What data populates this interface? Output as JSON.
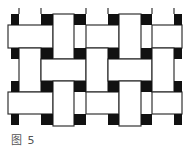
{
  "figure": {
    "caption": "图 5",
    "colors": {
      "background": "#ffffff",
      "ink": "#111111",
      "line": "#333333"
    }
  },
  "squares": [
    [
      11,
      14,
      8,
      11
    ],
    [
      41,
      14,
      12,
      11
    ],
    [
      74,
      14,
      12,
      11
    ],
    [
      108,
      14,
      11,
      11
    ],
    [
      141,
      14,
      11,
      11
    ],
    [
      174,
      14,
      8,
      11
    ],
    [
      11,
      48,
      8,
      11
    ],
    [
      41,
      48,
      12,
      11
    ],
    [
      74,
      48,
      12,
      11
    ],
    [
      108,
      48,
      11,
      11
    ],
    [
      141,
      48,
      11,
      11
    ],
    [
      174,
      48,
      8,
      11
    ],
    [
      11,
      81,
      8,
      11
    ],
    [
      41,
      81,
      12,
      11
    ],
    [
      74,
      81,
      12,
      11
    ],
    [
      108,
      81,
      11,
      11
    ],
    [
      141,
      81,
      11,
      11
    ],
    [
      174,
      81,
      8,
      11
    ],
    [
      11,
      114,
      8,
      11
    ],
    [
      41,
      114,
      12,
      11
    ],
    [
      74,
      114,
      12,
      11
    ],
    [
      108,
      114,
      11,
      11
    ],
    [
      141,
      114,
      11,
      11
    ],
    [
      174,
      114,
      8,
      11
    ]
  ],
  "rects": [
    [
      8,
      25,
      45,
      23
    ],
    [
      53,
      14,
      21,
      45
    ],
    [
      86,
      25,
      33,
      23
    ],
    [
      119,
      14,
      22,
      45
    ],
    [
      152,
      25,
      30,
      23
    ],
    [
      19,
      48,
      22,
      44
    ],
    [
      41,
      59,
      45,
      22
    ],
    [
      86,
      48,
      22,
      44
    ],
    [
      108,
      59,
      44,
      22
    ],
    [
      152,
      48,
      22,
      44
    ],
    [
      8,
      92,
      45,
      22
    ],
    [
      53,
      81,
      21,
      45
    ],
    [
      86,
      92,
      33,
      22
    ],
    [
      119,
      81,
      22,
      45
    ],
    [
      152,
      92,
      30,
      22
    ]
  ],
  "ticks": [
    [
      19,
      8,
      19,
      14
    ],
    [
      41,
      8,
      41,
      14
    ],
    [
      86,
      8,
      86,
      14
    ],
    [
      108,
      8,
      108,
      14
    ],
    [
      152,
      8,
      152,
      14
    ],
    [
      174,
      8,
      174,
      14
    ]
  ]
}
